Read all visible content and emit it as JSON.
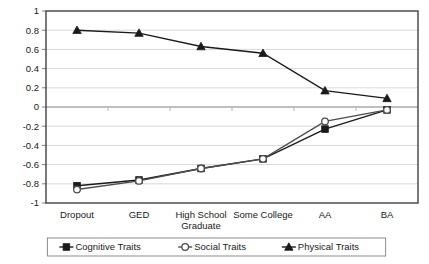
{
  "chart_data": {
    "type": "line",
    "title": "",
    "xlabel": "",
    "ylabel": "",
    "ylim": [
      -1,
      1
    ],
    "ytick_labels": [
      "1",
      "0.8",
      "0.6",
      "0.4",
      "0.2",
      "0",
      "-0.2",
      "-0.4",
      "-0.6",
      "-0.8",
      "-1"
    ],
    "ytick_values": [
      1,
      0.8,
      0.6,
      0.4,
      0.2,
      0,
      -0.2,
      -0.4,
      -0.6,
      -0.8,
      -1
    ],
    "grid": true,
    "grid_axis": "y",
    "legend_position": "bottom",
    "categories": [
      "Dropout",
      "GED",
      "High School Graduate",
      "Some College",
      "AA",
      "BA"
    ],
    "category_lines": [
      [
        "Dropout"
      ],
      [
        "GED"
      ],
      [
        "High School",
        "Graduate"
      ],
      [
        "Some College"
      ],
      [
        "AA"
      ],
      [
        "BA"
      ]
    ],
    "series": [
      {
        "name": "Cognitive Traits",
        "marker": "filled-square",
        "color": "#1a1a1a",
        "values": [
          -0.82,
          -0.76,
          -0.64,
          -0.54,
          -0.23,
          -0.03
        ]
      },
      {
        "name": "Social Traits",
        "marker": "open-circle",
        "color": "#4d4d4d",
        "values": [
          -0.86,
          -0.77,
          -0.64,
          -0.54,
          -0.15,
          -0.03
        ]
      },
      {
        "name": "Physical Traits",
        "marker": "filled-triangle",
        "color": "#1a1a1a",
        "values": [
          0.8,
          0.77,
          0.63,
          0.56,
          0.17,
          0.09
        ]
      }
    ]
  },
  "legend": {
    "items": [
      {
        "label": "Cognitive Traits",
        "marker": "filled-square"
      },
      {
        "label": "Social Traits",
        "marker": "open-circle"
      },
      {
        "label": "Physical Traits",
        "marker": "filled-triangle"
      }
    ]
  },
  "colors": {
    "axis": "#404040",
    "grid": "#d9d9d9",
    "zero_line": "#808080",
    "plot_border": "#404040",
    "background": "#ffffff",
    "text": "#1a1a1a"
  }
}
